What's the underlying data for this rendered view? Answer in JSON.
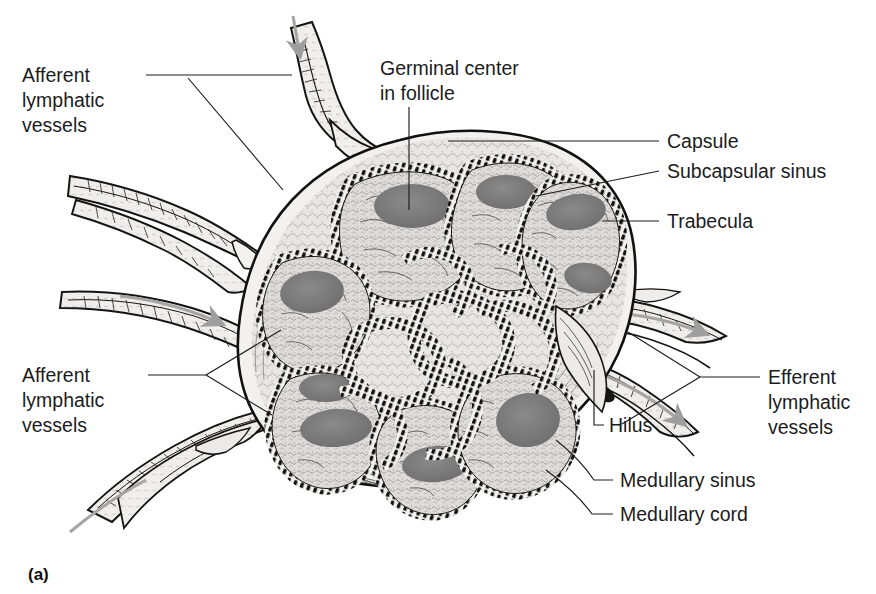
{
  "figure": {
    "caption": "(a)",
    "colors": {
      "ink": "#111111",
      "capsule_fill": "#f0efee",
      "cortex_fill": "#dcdbd9",
      "germinal_center": "#7d7d7d",
      "medulla_fill": "#e6e5e3",
      "flow_arrow": "#9a9a9a",
      "background": "#ffffff"
    },
    "labels": [
      {
        "id": "afferent-top-left",
        "lines": [
          "Afferent",
          "lymphatic",
          "vessels"
        ],
        "anchor": "start"
      },
      {
        "id": "germinal-center",
        "lines": [
          "Germinal center",
          "in follicle"
        ],
        "anchor": "start"
      },
      {
        "id": "capsule",
        "lines": [
          "Capsule"
        ],
        "anchor": "start"
      },
      {
        "id": "subcapsular-sinus",
        "lines": [
          "Subcapsular sinus"
        ],
        "anchor": "start"
      },
      {
        "id": "trabecula",
        "lines": [
          "Trabecula"
        ],
        "anchor": "start"
      },
      {
        "id": "afferent-bottom-left",
        "lines": [
          "Afferent",
          "lymphatic",
          "vessels"
        ],
        "anchor": "start"
      },
      {
        "id": "efferent",
        "lines": [
          "Efferent",
          "lymphatic",
          "vessels"
        ],
        "anchor": "start"
      },
      {
        "id": "hilus",
        "lines": [
          "Hilus"
        ],
        "anchor": "start"
      },
      {
        "id": "medullary-sinus",
        "lines": [
          "Medullary sinus"
        ],
        "anchor": "start"
      },
      {
        "id": "medullary-cord",
        "lines": [
          "Medullary cord"
        ],
        "anchor": "start"
      }
    ]
  },
  "text": {
    "afferent_1": "Afferent",
    "afferent_2": "lymphatic",
    "afferent_3": "vessels",
    "germinal_1": "Germinal center",
    "germinal_2": "in follicle",
    "capsule": "Capsule",
    "subcapsular": "Subcapsular sinus",
    "trabecula": "Trabecula",
    "afferent2_1": "Afferent",
    "afferent2_2": "lymphatic",
    "afferent2_3": "vessels",
    "efferent_1": "Efferent",
    "efferent_2": "lymphatic",
    "efferent_3": "vessels",
    "hilus": "Hilus",
    "medullary_sinus": "Medullary sinus",
    "medullary_cord": "Medullary cord",
    "caption": "(a)"
  }
}
